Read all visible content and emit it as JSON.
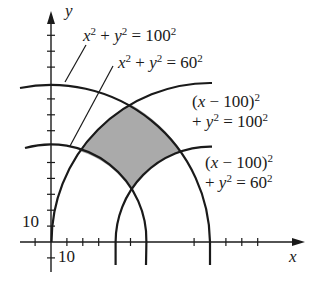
{
  "diagram": {
    "axis_labels": {
      "x": "x",
      "y": "y"
    },
    "tick_labels": {
      "x_tick": "10",
      "y_tick": "10"
    },
    "curves": [
      {
        "id": "c1",
        "equation": "x^2 + y^2 = 100^2",
        "center": [
          0,
          0
        ],
        "radius": 100
      },
      {
        "id": "c2",
        "equation": "x^2 + y^2 = 60^2",
        "center": [
          0,
          0
        ],
        "radius": 60
      },
      {
        "id": "c3",
        "equation": "(x - 100)^2 + y^2 = 100^2",
        "center": [
          100,
          0
        ],
        "radius": 100
      },
      {
        "id": "c4",
        "equation": "(x - 100)^2 + y^2 = 60^2",
        "center": [
          100,
          0
        ],
        "radius": 60
      }
    ],
    "labels": {
      "c1": {
        "a": "x",
        "b": "2",
        "c": " + ",
        "d": "y",
        "e": "2",
        "f": " = 100",
        "g": "2"
      },
      "c2": {
        "a": "x",
        "b": "2",
        "c": " + ",
        "d": "y",
        "e": "2",
        "f": " = 60",
        "g": "2"
      },
      "c3": {
        "l1a": "(",
        "l1b": "x",
        "l1c": " − 100)",
        "l1d": "2",
        "l2a": "+ ",
        "l2b": "y",
        "l2c": "2",
        "l2d": " = 100",
        "l2e": "2"
      },
      "c4": {
        "l1a": "(",
        "l1b": "x",
        "l1c": " − 100)",
        "l1d": "2",
        "l2a": "+ ",
        "l2b": "y",
        "l2c": "2",
        "l2d": " = 60",
        "l2e": "2"
      }
    },
    "shaded_region": "region between the circles, outside both radius-60 circles and inside both radius-100 circles",
    "colors": {
      "ink": "#1a1a1a",
      "shade": "#aaaaaa"
    }
  }
}
